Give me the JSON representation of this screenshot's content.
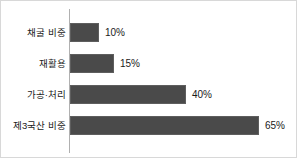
{
  "chart_data": {
    "type": "bar",
    "orientation": "horizontal",
    "title": "",
    "xlabel": "",
    "ylabel": "",
    "grid": false,
    "legend": false,
    "xlim": [
      0,
      65
    ],
    "unit": "%",
    "axis_color": "#b0b0b0",
    "bar_color": "#4a4a4a",
    "background_color": "#ffffff",
    "categories": [
      "채굴 비중",
      "재활용",
      "가공·처리",
      "제3국산 비중"
    ],
    "values": [
      10,
      15,
      40,
      65
    ],
    "value_labels": [
      "10%",
      "15%",
      "40%",
      "65%"
    ],
    "bars": [
      {
        "label": "채굴 비중",
        "value": 10,
        "value_label": "10%"
      },
      {
        "label": "재활용",
        "value": 15,
        "value_label": "15%"
      },
      {
        "label": "가공·처리",
        "value": 40,
        "value_label": "40%"
      },
      {
        "label": "제3국산 비중",
        "value": 65,
        "value_label": "65%"
      }
    ]
  }
}
